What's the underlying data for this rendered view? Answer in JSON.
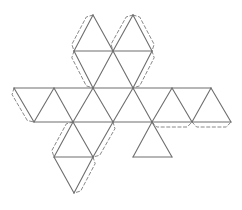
{
  "diagram": {
    "type": "icosahedron-net",
    "stroke_color": "#6e6e6e",
    "tab_color": "#7a7a7a",
    "vertices": {
      "A1": [
        93,
        15
      ],
      "A2": [
        133,
        15
      ],
      "B1": [
        74,
        51
      ],
      "B2": [
        113,
        51
      ],
      "B3": [
        152,
        51
      ],
      "C0": [
        14,
        88
      ],
      "C1": [
        54,
        88
      ],
      "C2": [
        93,
        88
      ],
      "C3": [
        133,
        88
      ],
      "C4": [
        172,
        88
      ],
      "C5": [
        211,
        88
      ],
      "D0": [
        34,
        122
      ],
      "D1": [
        73,
        122
      ],
      "D2": [
        113,
        122
      ],
      "D3": [
        152,
        122
      ],
      "D4": [
        192,
        122
      ],
      "D5": [
        231,
        122
      ],
      "E1": [
        54,
        157
      ],
      "E2": [
        93,
        157
      ],
      "E3": [
        133,
        157
      ],
      "E4": [
        172,
        157
      ],
      "F1": [
        74,
        193
      ]
    },
    "solid_edges": [
      [
        "A1",
        "B1"
      ],
      [
        "A1",
        "B2"
      ],
      [
        "A2",
        "B2"
      ],
      [
        "A2",
        "B3"
      ],
      [
        "B1",
        "B3"
      ],
      [
        "B1",
        "C2"
      ],
      [
        "B2",
        "C2"
      ],
      [
        "B2",
        "C3"
      ],
      [
        "B3",
        "C3"
      ],
      [
        "C0",
        "C5"
      ],
      [
        "C0",
        "D0"
      ],
      [
        "D0",
        "C1"
      ],
      [
        "C1",
        "D1"
      ],
      [
        "D1",
        "C2"
      ],
      [
        "C2",
        "D2"
      ],
      [
        "D2",
        "C3"
      ],
      [
        "C3",
        "D3"
      ],
      [
        "D3",
        "C4"
      ],
      [
        "C4",
        "D4"
      ],
      [
        "D4",
        "C5"
      ],
      [
        "C5",
        "D5"
      ],
      [
        "D0",
        "D5"
      ],
      [
        "D1",
        "E1"
      ],
      [
        "D1",
        "E2"
      ],
      [
        "D2",
        "E2"
      ],
      [
        "D3",
        "E3"
      ],
      [
        "D3",
        "E4"
      ],
      [
        "E1",
        "E2"
      ],
      [
        "E3",
        "E4"
      ],
      [
        "E1",
        "F1"
      ],
      [
        "E2",
        "F1"
      ]
    ],
    "tabs": [
      {
        "from": "A1",
        "to": "B1",
        "side": "left"
      },
      {
        "from": "B1",
        "to": "C2",
        "side": "left"
      },
      {
        "from": "A2",
        "to": "B2",
        "side": "left"
      },
      {
        "from": "A2",
        "to": "B3",
        "side": "right"
      },
      {
        "from": "B3",
        "to": "C3",
        "side": "right"
      },
      {
        "from": "C0",
        "to": "D0",
        "side": "left"
      },
      {
        "from": "D3",
        "to": "D4",
        "side": "below"
      },
      {
        "from": "D4",
        "to": "D5",
        "side": "below"
      },
      {
        "from": "D1",
        "to": "E1",
        "side": "left"
      },
      {
        "from": "D2",
        "to": "E2",
        "side": "right"
      },
      {
        "from": "E2",
        "to": "F1",
        "side": "right"
      }
    ]
  }
}
